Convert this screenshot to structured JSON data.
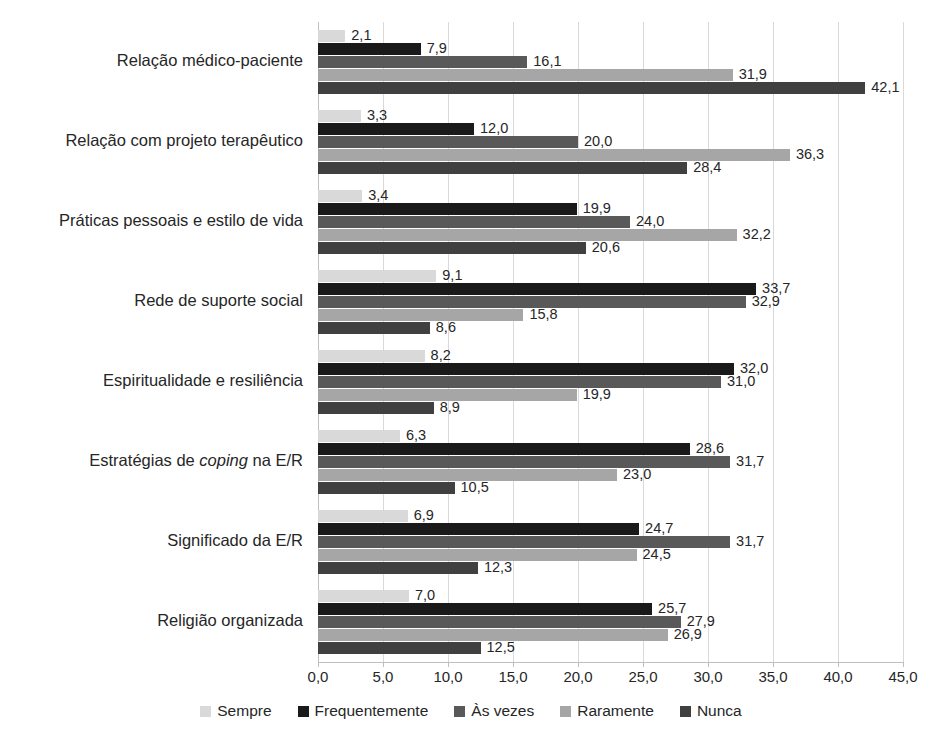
{
  "chart_data": {
    "type": "bar",
    "orientation": "horizontal",
    "title": "",
    "xlabel": "",
    "ylabel": "",
    "xlim": [
      0,
      45
    ],
    "xticks": [
      "0,0",
      "5,0",
      "10,0",
      "15,0",
      "20,0",
      "25,0",
      "30,0",
      "35,0",
      "40,0",
      "45,0"
    ],
    "xtick_values": [
      0,
      5,
      10,
      15,
      20,
      25,
      30,
      35,
      40,
      45
    ],
    "grid": true,
    "legend_position": "bottom",
    "categories": [
      "Relação médico-paciente",
      "Relação com projeto terapêutico",
      "Práticas pessoais e estilo de vida",
      "Rede de suporte social",
      "Espiritualidade e resiliência",
      "Estratégias de coping na E/R",
      "Significado da E/R",
      "Religião organizada"
    ],
    "category_parts": [
      [
        {
          "t": "Relação médico-paciente",
          "i": false
        }
      ],
      [
        {
          "t": "Relação com projeto terapêutico",
          "i": false
        }
      ],
      [
        {
          "t": "Práticas pessoais e estilo de vida",
          "i": false
        }
      ],
      [
        {
          "t": "Rede de suporte social",
          "i": false
        }
      ],
      [
        {
          "t": "Espiritualidade e resiliência",
          "i": false
        }
      ],
      [
        {
          "t": "Estratégias de ",
          "i": false
        },
        {
          "t": "coping",
          "i": true
        },
        {
          "t": " na E/R",
          "i": false
        }
      ],
      [
        {
          "t": "Significado da E/R",
          "i": false
        }
      ],
      [
        {
          "t": "Religião organizada",
          "i": false
        }
      ]
    ],
    "series": [
      {
        "name": "Sempre",
        "color": "#d9d9d9",
        "values": [
          2.1,
          3.3,
          3.4,
          9.1,
          8.2,
          6.3,
          6.9,
          7.0
        ],
        "labels": [
          "2,1",
          "3,3",
          "3,4",
          "9,1",
          "8,2",
          "6,3",
          "6,9",
          "7,0"
        ]
      },
      {
        "name": "Frequentemente",
        "color": "#1a1a1a",
        "values": [
          7.9,
          12.0,
          19.9,
          33.7,
          32.0,
          28.6,
          24.7,
          25.7
        ],
        "labels": [
          "7,9",
          "12,0",
          "19,9",
          "33,7",
          "32,0",
          "28,6",
          "24,7",
          "25,7"
        ]
      },
      {
        "name": "Às vezes",
        "color": "#595959",
        "values": [
          16.1,
          20.0,
          24.0,
          32.9,
          31.0,
          31.7,
          31.7,
          27.9
        ],
        "labels": [
          "16,1",
          "20,0",
          "24,0",
          "32,9",
          "31,0",
          "31,7",
          "31,7",
          "27,9"
        ]
      },
      {
        "name": "Raramente",
        "color": "#a6a6a6",
        "values": [
          31.9,
          36.3,
          32.2,
          15.8,
          19.9,
          23.0,
          24.5,
          26.9
        ],
        "labels": [
          "31,9",
          "36,3",
          "32,2",
          "15,8",
          "19,9",
          "23,0",
          "24,5",
          "26,9"
        ]
      },
      {
        "name": "Nunca",
        "color": "#404040",
        "values": [
          42.1,
          28.4,
          20.6,
          8.6,
          8.9,
          10.5,
          12.3,
          12.5
        ],
        "labels": [
          "42,1",
          "28,4",
          "20,6",
          "8,6",
          "8,9",
          "10,5",
          "12,3",
          "12,5"
        ]
      }
    ]
  },
  "legend": {
    "items": [
      {
        "label": "Sempre",
        "color": "#d9d9d9"
      },
      {
        "label": "Frequentemente",
        "color": "#1a1a1a"
      },
      {
        "label": "Às vezes",
        "color": "#595959"
      },
      {
        "label": "Raramente",
        "color": "#a6a6a6"
      },
      {
        "label": "Nunca",
        "color": "#404040"
      }
    ]
  },
  "colors": {
    "background": "#ffffff",
    "gridline": "#d9d9d9",
    "axis": "#bfbfbf",
    "text": "#262626"
  }
}
